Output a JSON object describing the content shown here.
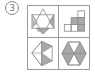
{
  "question": {
    "number_label": "3",
    "marker": "circled-number"
  },
  "figures": [
    {
      "id": "top-left",
      "description": "six-pointed star of triangles with some shaded and small circles"
    },
    {
      "id": "top-right",
      "description": "staircase of squares with shaded cells"
    },
    {
      "id": "bottom-left",
      "description": "polygon fan with shaded triangles"
    },
    {
      "id": "bottom-right",
      "description": "hexagon divided into triangles with alternating shading"
    }
  ],
  "colors": {
    "line": "#888888",
    "shade": "#a8a8a8",
    "background": "#ffffff"
  }
}
